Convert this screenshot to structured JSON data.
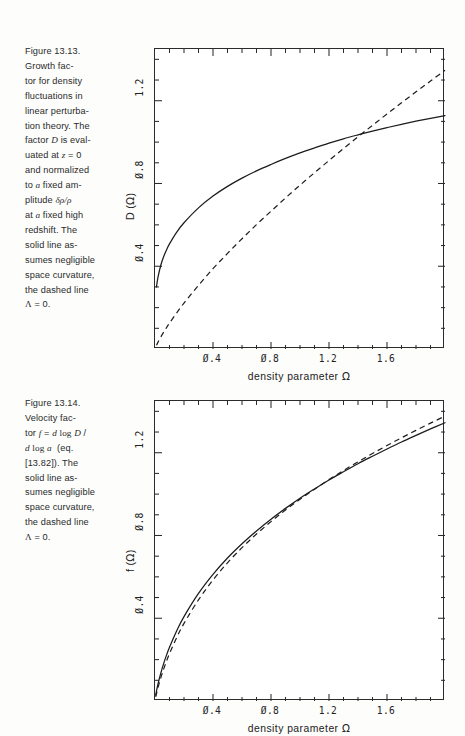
{
  "page": {
    "background": "#fdfdfc",
    "ink": "#1a1a1a"
  },
  "figures": [
    {
      "id": "figure-13-13",
      "caption_lines": [
        "Figure 13.13.",
        "Growth fac-",
        "tor for density",
        "fluctuations in",
        "linear perturba-",
        "tion theory. The",
        "factor D is eval-",
        "uated at z = 0",
        "and normalized",
        "to a fixed am-",
        "plitude δρ/ρ",
        "at a fixed high",
        "redshift. The",
        "solid line as-",
        "sumes negligible",
        "space curvature,",
        "the dashed line",
        "Λ = 0."
      ],
      "caption_label": "Figure 13.13.",
      "xlabel": "density  parameter  Ω",
      "ylabel": "D (Ω)",
      "xticks": [
        "0.4",
        "0.8",
        "1.2",
        "1.6"
      ],
      "yticks": [
        "0.4",
        "0.8",
        "1.2"
      ]
    },
    {
      "id": "figure-13-14",
      "caption_lines": [
        "Figure 13.14.",
        "Velocity fac-",
        "tor f = d log D /",
        "d log a  (eq.",
        "[13.82]). The",
        "solid line as-",
        "sumes negligible",
        "space curvature,",
        "the dashed line",
        "Λ = 0."
      ],
      "caption_label": "Figure 13.14.",
      "xlabel": "density  parameter  Ω",
      "ylabel": "f (Ω)",
      "xticks": [
        "0.4",
        "0.8",
        "1.2",
        "1.6"
      ],
      "yticks": [
        "0.4",
        "0.8",
        "1.2"
      ]
    }
  ],
  "chart_data": [
    {
      "type": "line",
      "id": "figure-13-13",
      "title": "Growth factor D as a function of density parameter Omega",
      "xlabel": "density parameter Ω",
      "ylabel": "D (Ω)",
      "xlim": [
        0.0,
        2.0
      ],
      "ylim": [
        0.0,
        1.45
      ],
      "xticks": [
        0.4,
        0.8,
        1.2,
        1.6
      ],
      "yticks": [
        0.4,
        0.8,
        1.2
      ],
      "grid": false,
      "legend": null,
      "series": [
        {
          "name": "solid line - negligible space curvature (flat, Lambda)",
          "style": "solid",
          "color": "#1c1c1c",
          "x": [
            0.01,
            0.02,
            0.04,
            0.06,
            0.08,
            0.1,
            0.15,
            0.2,
            0.3,
            0.4,
            0.5,
            0.6,
            0.7,
            0.8,
            0.9,
            1.0,
            1.1,
            1.2,
            1.3,
            1.4,
            1.5,
            1.6,
            1.7,
            1.8,
            1.9,
            2.0
          ],
          "y": [
            0.3,
            0.345,
            0.405,
            0.447,
            0.48,
            0.508,
            0.565,
            0.61,
            0.682,
            0.739,
            0.786,
            0.826,
            0.861,
            0.892,
            0.921,
            0.948,
            0.972,
            0.995,
            1.016,
            1.035,
            1.053,
            1.07,
            1.086,
            1.101,
            1.115,
            1.128
          ]
        },
        {
          "name": "dashed line - Lambda = 0 (open, curved)",
          "style": "dashed",
          "color": "#1c1c1c",
          "x": [
            0.01,
            0.02,
            0.04,
            0.06,
            0.08,
            0.1,
            0.15,
            0.2,
            0.3,
            0.4,
            0.5,
            0.6,
            0.7,
            0.8,
            0.9,
            1.0,
            1.1,
            1.2,
            1.3,
            1.4,
            1.5,
            1.6,
            1.7,
            1.8,
            1.9,
            2.0
          ],
          "y": [
            0.018,
            0.032,
            0.058,
            0.082,
            0.104,
            0.125,
            0.175,
            0.222,
            0.308,
            0.388,
            0.462,
            0.533,
            0.601,
            0.666,
            0.73,
            0.792,
            0.852,
            0.911,
            0.969,
            1.026,
            1.081,
            1.136,
            1.19,
            1.243,
            1.295,
            1.347
          ]
        }
      ],
      "annotations": [
        "solid and dashed curves intersect near (1.0, 1.0)"
      ]
    },
    {
      "type": "line",
      "id": "figure-13-14",
      "title": "Velocity factor f as a function of density parameter Omega",
      "xlabel": "density parameter Ω",
      "ylabel": "f (Ω)",
      "xlim": [
        0.0,
        2.0
      ],
      "ylim": [
        0.0,
        1.45
      ],
      "xticks": [
        0.4,
        0.8,
        1.2,
        1.6
      ],
      "yticks": [
        0.4,
        0.8,
        1.2
      ],
      "grid": false,
      "legend": null,
      "series": [
        {
          "name": "solid line - negligible space curvature (flat, Lambda)",
          "style": "solid",
          "color": "#1c1c1c",
          "x": [
            0.005,
            0.01,
            0.02,
            0.04,
            0.06,
            0.08,
            0.1,
            0.15,
            0.2,
            0.3,
            0.4,
            0.5,
            0.6,
            0.7,
            0.8,
            0.9,
            1.0,
            1.1,
            1.2,
            1.3,
            1.4,
            1.5,
            1.6,
            1.7,
            1.8,
            1.9,
            2.0
          ],
          "y": [
            0.028,
            0.047,
            0.08,
            0.135,
            0.182,
            0.223,
            0.26,
            0.34,
            0.408,
            0.52,
            0.612,
            0.691,
            0.76,
            0.822,
            0.879,
            0.931,
            0.98,
            1.025,
            1.068,
            1.108,
            1.147,
            1.183,
            1.218,
            1.252,
            1.284,
            1.315,
            1.345
          ]
        },
        {
          "name": "dashed line - Lambda = 0 (open)",
          "style": "dashed",
          "color": "#1c1c1c",
          "x": [
            0.005,
            0.01,
            0.02,
            0.04,
            0.06,
            0.08,
            0.1,
            0.15,
            0.2,
            0.3,
            0.4,
            0.5,
            0.6,
            0.7,
            0.8,
            0.9,
            1.0,
            1.1,
            1.2,
            1.3,
            1.4,
            1.5,
            1.6,
            1.7,
            1.8,
            1.9,
            2.0
          ],
          "y": [
            0.02,
            0.035,
            0.063,
            0.112,
            0.155,
            0.194,
            0.229,
            0.307,
            0.375,
            0.489,
            0.585,
            0.668,
            0.741,
            0.807,
            0.867,
            0.923,
            0.975,
            1.024,
            1.07,
            1.114,
            1.156,
            1.196,
            1.235,
            1.272,
            1.308,
            1.343,
            1.377
          ]
        }
      ],
      "annotations": [
        "the two curves nearly coincide over the whole range"
      ]
    }
  ]
}
